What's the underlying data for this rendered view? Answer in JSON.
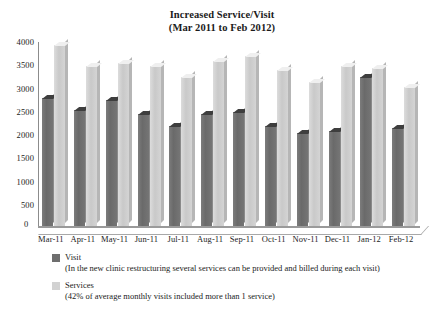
{
  "chart_data": {
    "type": "bar",
    "title": "Increased Service/Visit",
    "subtitle": "(Mar 2011 to Feb 2012)",
    "xlabel": "",
    "ylabel": "",
    "ylim": [
      0,
      4000
    ],
    "ytick_step": 500,
    "yticks": [
      "4000",
      "3500",
      "3000",
      "2500",
      "2000",
      "1500",
      "1000",
      "500",
      "0"
    ],
    "grid": false,
    "legend_position": "below",
    "categories": [
      "Mar-11",
      "Apr-11",
      "May-11",
      "Jun-11",
      "Jul-11",
      "Aug-11",
      "Sep-11",
      "Oct-11",
      "Nov-11",
      "Dec-11",
      "Jan-12",
      "Feb-12"
    ],
    "series": [
      {
        "name": "Visit",
        "color": "#6e6e6e",
        "values": [
          2750,
          2500,
          2700,
          2400,
          2150,
          2400,
          2450,
          2150,
          2000,
          2050,
          3200,
          2100
        ]
      },
      {
        "name": "Services",
        "color": "#d2d2d2",
        "values": [
          3900,
          3450,
          3500,
          3450,
          3200,
          3550,
          3650,
          3350,
          3100,
          3450,
          3400,
          3000
        ]
      }
    ]
  },
  "legend": {
    "entries": [
      {
        "label": "Visit",
        "note": "(In the new clinic restructuring several services can be provided and billed during each visit)",
        "swatch": "#6e6e6e"
      },
      {
        "label": "Services",
        "note": "(42% of average monthly visits included more than 1 service)",
        "swatch": "#d2d2d2"
      }
    ]
  }
}
